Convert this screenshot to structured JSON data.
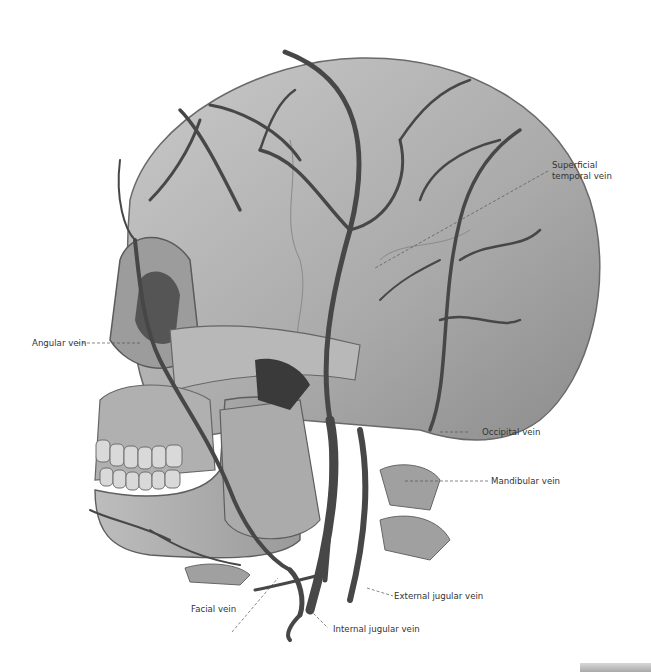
{
  "figure": {
    "labels": [
      {
        "id": "superficial-temporal-vein",
        "text_line1": "Superficial",
        "text_line2": "temporal vein"
      },
      {
        "id": "angular-vein",
        "text": "Angular vein"
      },
      {
        "id": "occipital-vein",
        "text": "Occipital vein"
      },
      {
        "id": "mandibular-vein",
        "text": "Mandibular vein"
      },
      {
        "id": "external-jugular-vein",
        "text": "External jugular vein"
      },
      {
        "id": "facial-vein",
        "text": "Facial vein"
      },
      {
        "id": "internal-jugular-vein",
        "text": "Internal jugular vein"
      }
    ],
    "colors": {
      "bone": "#b5b5b5",
      "bone_dark": "#7a7a7a",
      "vein": "#4a4a4a",
      "background": "#ffffff",
      "label": "#333333"
    }
  }
}
